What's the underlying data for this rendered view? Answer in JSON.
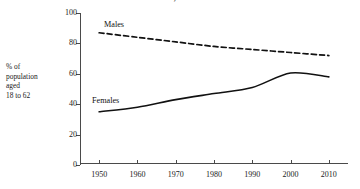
{
  "chart_data": {
    "type": "line",
    "title": "Women, 1950-2010",
    "title_clipped": true,
    "xlabel": "",
    "ylabel": "% of population aged 18 to 62",
    "x": [
      1950,
      1960,
      1970,
      1980,
      1990,
      2000,
      2010
    ],
    "xtick_labels": [
      "1950",
      "1960",
      "1970",
      "1980",
      "1990",
      "2000",
      "2010"
    ],
    "ytick_labels": [
      "0",
      "20",
      "40",
      "60",
      "80",
      "100"
    ],
    "yticks": [
      0,
      20,
      40,
      60,
      80,
      100
    ],
    "xlim": [
      1945,
      2015
    ],
    "ylim": [
      0,
      100
    ],
    "grid": false,
    "legend_position": "inline-labels",
    "series": [
      {
        "name": "Males",
        "style": "dashed",
        "color": "#111111",
        "values": [
          87,
          84,
          81,
          78,
          76,
          74,
          72
        ]
      },
      {
        "name": "Females",
        "style": "solid",
        "color": "#111111",
        "values": [
          35,
          38,
          43,
          47,
          51,
          60.5,
          58
        ]
      }
    ]
  },
  "axis_caption": {
    "line1": "% of",
    "line2": "population",
    "line3": "aged",
    "line4": "18 to 62"
  },
  "series_labels": {
    "males": "Males",
    "females": "Females"
  }
}
